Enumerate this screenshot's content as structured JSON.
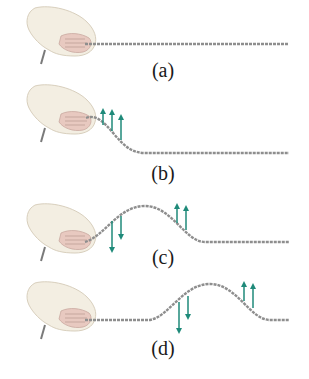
{
  "diagram": {
    "colors": {
      "rope": "#8e8e8e",
      "arrow": "#1f8a7a",
      "hand": "#f3eee2",
      "hand_outline": "#d8cfbd",
      "label": "#1a1a1a"
    },
    "panels": [
      {
        "id": "a",
        "label": "(a)",
        "description": "Rope at rest, held by hand",
        "arrows": []
      },
      {
        "id": "b",
        "label": "(b)",
        "description": "Hand moves up, rising front of pulse",
        "arrows": [
          "up",
          "up",
          "up"
        ]
      },
      {
        "id": "c",
        "label": "(c)",
        "description": "Full pulse formed; trailing edge moves down, leading edge moves up",
        "arrows": [
          "down",
          "down",
          "up",
          "up"
        ]
      },
      {
        "id": "d",
        "label": "(d)",
        "description": "Pulse travels to the right along the rope",
        "arrows": [
          "down",
          "down",
          "up",
          "up"
        ]
      }
    ]
  }
}
